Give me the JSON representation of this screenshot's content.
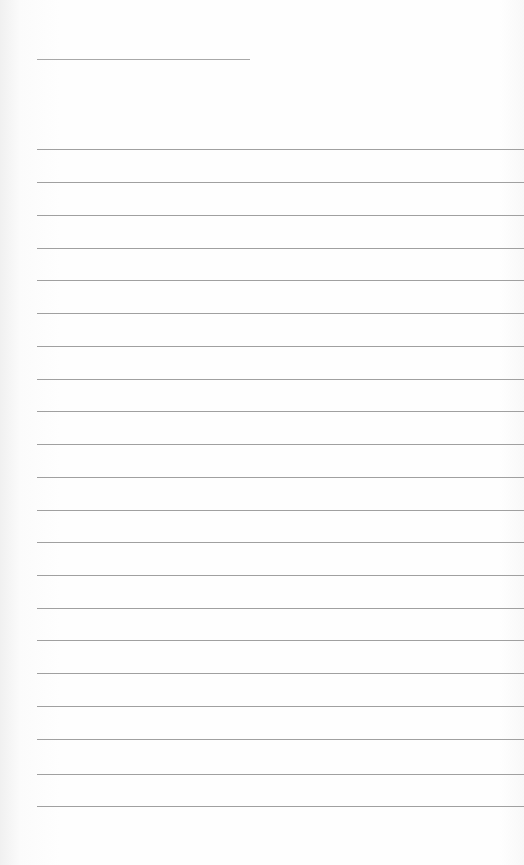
{
  "page": {
    "type": "lined-notepad",
    "background_color": "#fdfdfd",
    "line_color": "#a0a0a0",
    "title_line": {
      "left": 37,
      "top": 59,
      "width": 213
    },
    "ruled_lines": {
      "left": 37,
      "positions": [
        149,
        182,
        215,
        248,
        280,
        313,
        346,
        379,
        411,
        444,
        477,
        510,
        542,
        575,
        608,
        640,
        673,
        706,
        739,
        774,
        806
      ]
    }
  }
}
